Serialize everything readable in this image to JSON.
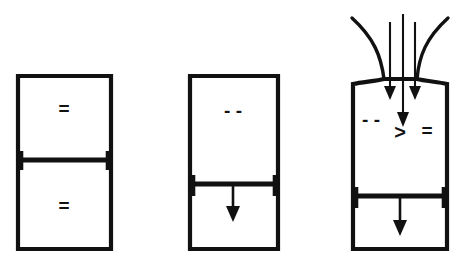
{
  "figure": {
    "background_color": "#ffffff",
    "stroke_color": "#111111",
    "title": "",
    "panel_count": 3
  },
  "panels": [
    {
      "id": "panel-equilibrium",
      "name": "left-panel",
      "vessel": {
        "x": 18,
        "y": 76,
        "width": 93,
        "height": 173
      },
      "divider": {
        "y": 160,
        "label": "piston-divider"
      },
      "upper_chamber": {
        "glyph": "=",
        "glyph_name": "equals-symbol",
        "glyph_x": 64,
        "glyph_y": 110
      },
      "lower_chamber": {
        "glyph": "=",
        "glyph_name": "equals-symbol",
        "glyph_x": 64,
        "glyph_y": 207
      },
      "has_flow_arrows": false,
      "has_funnel": false,
      "has_inner_arrow": false
    },
    {
      "id": "panel-expansion",
      "name": "middle-panel",
      "vessel": {
        "x": 190,
        "y": 76,
        "width": 88,
        "height": 173
      },
      "divider": {
        "y": 184,
        "label": "piston-divider"
      },
      "upper_chamber": {
        "glyph": "-   -",
        "glyph_name": "double-dash-symbol",
        "glyph_x": 233,
        "glyph_y": 112
      },
      "lower_chamber": {
        "glyph": "",
        "glyph_name": "empty-chamber",
        "glyph_x": 233,
        "glyph_y": 215
      },
      "has_flow_arrows": false,
      "has_funnel": false,
      "has_inner_arrow": true,
      "inner_arrow": {
        "x": 233,
        "y_start": 186,
        "y_end": 218
      }
    },
    {
      "id": "panel-inflow",
      "name": "right-panel",
      "vessel": {
        "x": 353,
        "y": 78,
        "width": 94,
        "height": 171
      },
      "divider": {
        "y": 196,
        "label": "piston-divider"
      },
      "upper_chamber": {
        "glyph": "- -",
        "glyph_name": "double-dash-symbol",
        "glyph_x": 371,
        "glyph_y": 121,
        "secondary_glyphs": [
          {
            "glyph": ">",
            "glyph_name": "greater-than-symbol",
            "glyph_x": 400,
            "glyph_y": 134
          },
          {
            "glyph": "=",
            "glyph_name": "equals-symbol",
            "glyph_x": 427,
            "glyph_y": 132
          }
        ]
      },
      "lower_chamber": {
        "glyph": "",
        "glyph_name": "empty-chamber",
        "glyph_x": 400,
        "glyph_y": 225
      },
      "has_flow_arrows": true,
      "has_funnel": true,
      "has_inner_arrow": true,
      "inner_arrow": {
        "x": 400,
        "y_start": 198,
        "y_end": 232
      },
      "flow_arrows": [
        {
          "name": "inflow-arrow-left",
          "x": 390,
          "y_start": 22,
          "y_end": 98
        },
        {
          "name": "inflow-arrow-center",
          "x": 403,
          "y_start": 14,
          "y_end": 126
        },
        {
          "name": "inflow-arrow-right",
          "x": 415,
          "y_start": 22,
          "y_end": 98
        }
      ],
      "funnel_curves": [
        {
          "name": "funnel-curve-left"
        },
        {
          "name": "funnel-curve-right"
        }
      ]
    }
  ]
}
